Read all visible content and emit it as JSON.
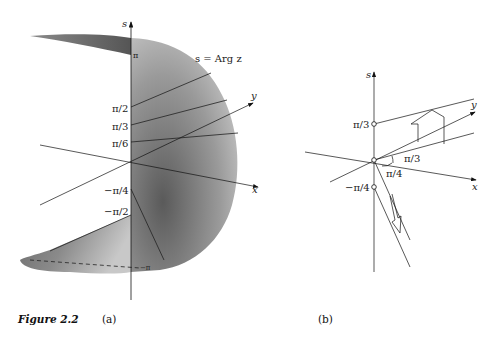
{
  "figure": {
    "caption_label": "Figure 2.2",
    "panel_a_label": "(a)",
    "panel_b_label": "(b)"
  },
  "panel_a": {
    "axes": {
      "s": "s",
      "x": "x",
      "y": "y"
    },
    "surface_label": "s = Arg z",
    "ticks": [
      "π",
      "π/2",
      "π/3",
      "π/6",
      "−π/4",
      "−π/2",
      "−π"
    ],
    "colors": {
      "surface_dark": "#555555",
      "surface_light": "#d8d8d8"
    }
  },
  "panel_b": {
    "axes": {
      "s": "s",
      "x": "x",
      "y": "y"
    },
    "ticks": [
      "π/3",
      "−π/4"
    ],
    "angle_labels": [
      "π/3",
      "π/4"
    ]
  }
}
